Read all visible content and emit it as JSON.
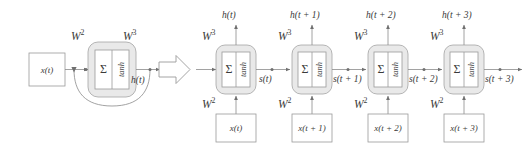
{
  "figure": {
    "kind": "rnn-folded-and-unfolded-diagram",
    "colors": {
      "stroke": "#8a8a8a",
      "cell_fill": "#ececec",
      "inner_fill": "#ffffff",
      "text": "#3a3a3a",
      "background": "#ffffff"
    }
  },
  "left_panel": {
    "name": "folded-rnn",
    "input_box_label": "x(t)",
    "weight_in_label": "W",
    "weight_in_sup": "2",
    "weight_out_label": "W",
    "weight_out_sup": "3",
    "output_label": "h(t)",
    "cell": {
      "sum_label": "Σ",
      "activation_label": "tanh"
    }
  },
  "transition_arrow": {
    "name": "unroll-arrow",
    "direction": "right"
  },
  "right_panel": {
    "name": "unfolded-rnn",
    "steps": [
      {
        "index": 0,
        "output_label": "h(t)",
        "weight_out_label": "W",
        "weight_out_sup": "3",
        "weight_in_label": "W",
        "weight_in_sup": "2",
        "input_box_label": "x(t)",
        "state_label": "s(t)",
        "cell": {
          "sum_label": "Σ",
          "activation_label": "tanh"
        }
      },
      {
        "index": 1,
        "output_label": "h(t + 1)",
        "weight_out_label": "W",
        "weight_out_sup": "3",
        "weight_in_label": "W",
        "weight_in_sup": "2",
        "input_box_label": "x(t + 1)",
        "state_label": "s(t + 1)",
        "cell": {
          "sum_label": "Σ",
          "activation_label": "tanh"
        }
      },
      {
        "index": 2,
        "output_label": "h(t + 2)",
        "weight_out_label": "W",
        "weight_out_sup": "3",
        "weight_in_label": "W",
        "weight_in_sup": "2",
        "input_box_label": "x(t + 2)",
        "state_label": "s(t + 2)",
        "cell": {
          "sum_label": "Σ",
          "activation_label": "tanh"
        }
      },
      {
        "index": 3,
        "output_label": "h(t + 3)",
        "weight_out_label": "W",
        "weight_out_sup": "3",
        "weight_in_label": "W",
        "weight_in_sup": "2",
        "input_box_label": "x(t + 3)",
        "state_label": "s(t + 3)",
        "cell": {
          "sum_label": "Σ",
          "activation_label": "tanh"
        }
      }
    ]
  }
}
